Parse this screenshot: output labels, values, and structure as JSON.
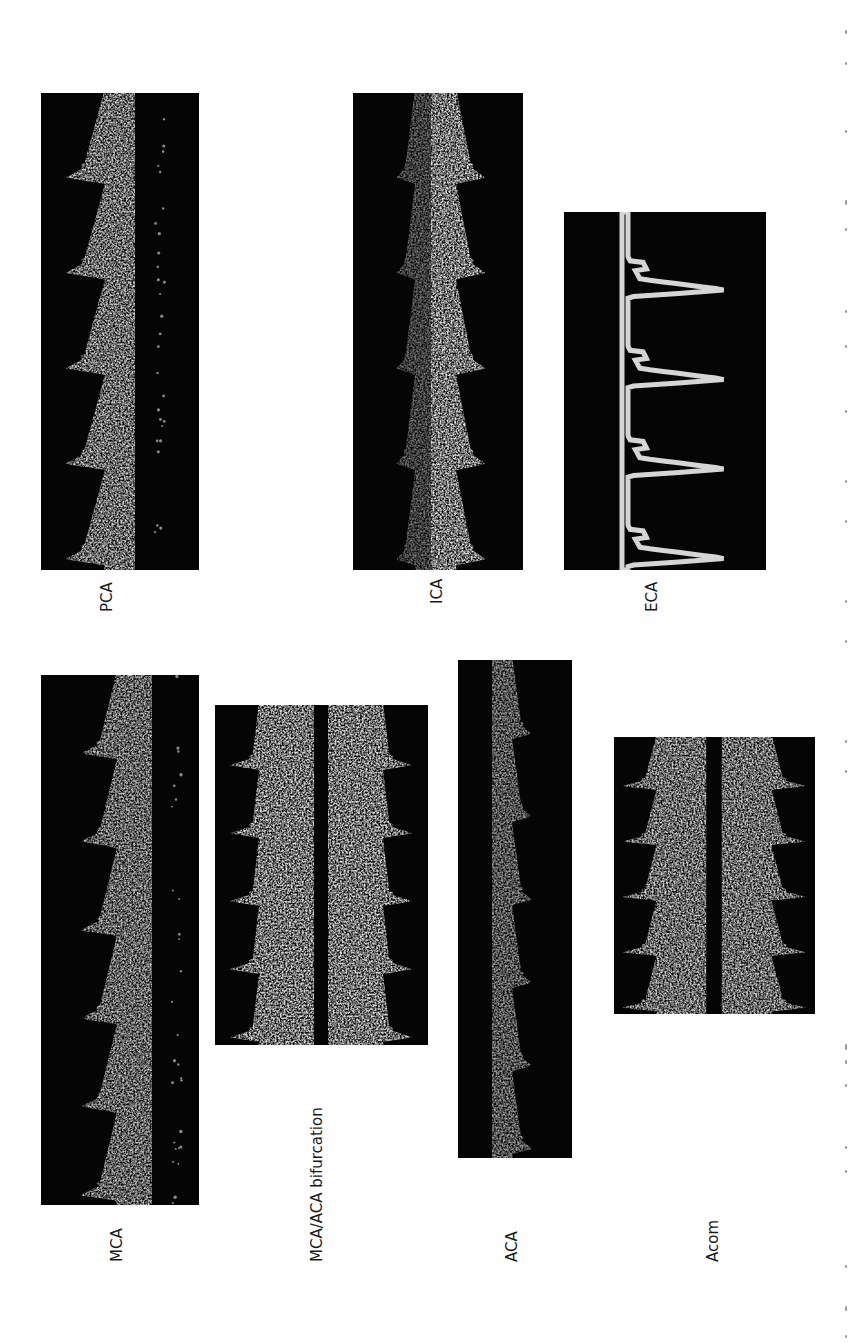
{
  "figure": {
    "orientation": "rotated -90deg (landscape figure on portrait page)",
    "background": "#ffffff",
    "panel_background": "#050505",
    "signal_color": "#d9d9d9"
  },
  "panels": [
    {
      "id": "pca",
      "label": "PCA",
      "x": 41,
      "y": 93,
      "w": 158,
      "h": 477,
      "baseline": 94,
      "direction": "left",
      "cycles": 5,
      "peak": 70,
      "diastolic": 30,
      "mirror": false,
      "brightness": 0.82,
      "label_x": 100,
      "label_y": 612,
      "noise_dots": true
    },
    {
      "id": "ica",
      "label": "ICA",
      "x": 353,
      "y": 93,
      "w": 170,
      "h": 477,
      "baseline": 78,
      "direction": "right",
      "cycles": 5,
      "peak": 55,
      "diastolic": 25,
      "mirror": true,
      "mirror_peak": 35,
      "mirror_dim": 0.45,
      "brightness": 0.9,
      "label_x": 430,
      "label_y": 604
    },
    {
      "id": "eca",
      "label": "ECA",
      "x": 564,
      "y": 212,
      "w": 202,
      "h": 358,
      "baseline": 58,
      "direction": "right",
      "cycles": 4,
      "peak": 105,
      "diastolic": 6,
      "spiky": true,
      "mirror": false,
      "brightness": 0.85,
      "label_x": 645,
      "label_y": 612
    },
    {
      "id": "mca",
      "label": "MCA",
      "x": 41,
      "y": 675,
      "w": 158,
      "h": 530,
      "baseline": 111,
      "direction": "left",
      "cycles": 6,
      "peak": 72,
      "diastolic": 35,
      "mirror": false,
      "brightness": 0.75,
      "label_x": 110,
      "label_y": 1262,
      "noise_dots": true
    },
    {
      "id": "mca-aca",
      "label": "MCA/ACA bifurcation",
      "x": 215,
      "y": 705,
      "w": 213,
      "h": 340,
      "baseline": 106,
      "direction": "both",
      "cycles": 5,
      "peak": 85,
      "diastolic": 55,
      "mirror": true,
      "mirror_peak": 85,
      "mirror_dim": 1.0,
      "gap": 14,
      "brightness": 0.88,
      "label_x": 310,
      "label_y": 1262
    },
    {
      "id": "aca",
      "label": "ACA",
      "x": 458,
      "y": 660,
      "w": 114,
      "h": 498,
      "baseline": 34,
      "direction": "right",
      "cycles": 6,
      "peak": 40,
      "diastolic": 20,
      "mirror": false,
      "brightness": 0.6,
      "label_x": 505,
      "label_y": 1262
    },
    {
      "id": "acom",
      "label": "Acom",
      "x": 614,
      "y": 737,
      "w": 201,
      "h": 277,
      "baseline": 100,
      "direction": "both",
      "cycles": 5,
      "peak": 85,
      "diastolic": 50,
      "mirror": true,
      "mirror_peak": 85,
      "mirror_dim": 1.0,
      "gap": 15,
      "brightness": 0.82,
      "label_x": 706,
      "label_y": 1262
    }
  ],
  "caption": {
    "visible": "partially cut off at right edge; text illegible"
  }
}
